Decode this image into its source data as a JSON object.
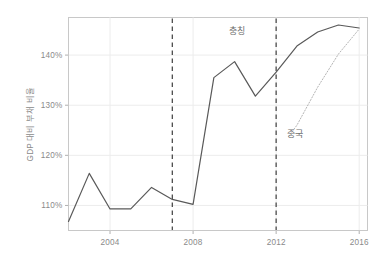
{
  "chart_data": {
    "type": "line",
    "title": "",
    "xlabel": "",
    "ylabel": "GDP 대비 부채 비율",
    "xlim": [
      2002,
      2016.4
    ],
    "ylim": [
      105.0,
      147.5
    ],
    "grid": true,
    "legend_position": "inline-annotations",
    "ytick_labels": [
      "110%",
      "120%",
      "130%",
      "140%"
    ],
    "ytick_values": [
      110,
      120,
      130,
      140
    ],
    "xtick_labels": [
      "2004",
      "2008",
      "2012",
      "2016"
    ],
    "xtick_values": [
      2004,
      2008,
      2012,
      2016
    ],
    "series": [
      {
        "name": "충칭",
        "style": "solid",
        "color": "#595959",
        "x": [
          2002.0,
          2003.0,
          2004.0,
          2005.0,
          2006.0,
          2007.0,
          2008.0,
          2009.0,
          2010.0,
          2011.0,
          2012.0,
          2013.0,
          2014.0,
          2015.0,
          2016.0
        ],
        "values": [
          106.8,
          116.4,
          109.3,
          109.3,
          113.6,
          111.2,
          110.2,
          135.5,
          138.7,
          131.8,
          136.6,
          141.8,
          144.6,
          146.0,
          145.4
        ]
      },
      {
        "name": "중국",
        "style": "dotted",
        "color": "#b4b4b4",
        "x": [
          2012.6,
          2013.0,
          2014.0,
          2015.0,
          2016.0
        ],
        "values": [
          123.8,
          126.0,
          133.6,
          140.2,
          145.2
        ]
      }
    ],
    "vlines": [
      {
        "x": 2007.0,
        "style": "dashed",
        "color": "#4d4d4d"
      },
      {
        "x": 2012.0,
        "style": "dashed",
        "color": "#4d4d4d"
      }
    ],
    "annotations": [
      {
        "text": "충칭",
        "x": 2010.1,
        "y": 144.2,
        "series": "충칭"
      },
      {
        "text": "중국",
        "x": 2012.9,
        "y": 123.6,
        "series": "중국"
      }
    ]
  },
  "colors": {
    "background": "#ffffff",
    "plot_border": "#c8c8c8",
    "gridline": "#ececec",
    "tick_label": "#8a8a8a",
    "axis_title": "#8a8a8a",
    "chongqing_line": "#595959",
    "china_line": "#b4b4b4",
    "vline": "#4d4d4d"
  }
}
